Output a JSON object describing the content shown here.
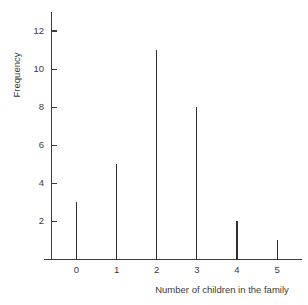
{
  "chart_data": {
    "type": "bar",
    "title": "",
    "subtitle": "",
    "xlabel": "Number of children in the family",
    "ylabel": "Frequency",
    "categories": [
      "0",
      "1",
      "2",
      "3",
      "4",
      "5"
    ],
    "values": [
      3,
      5,
      11,
      8,
      2,
      1
    ],
    "series": [
      {
        "name": "Frequency",
        "values": [
          3,
          5,
          11,
          8,
          2,
          1
        ]
      }
    ],
    "x": [
      0,
      1,
      2,
      3,
      4,
      5
    ],
    "xlim": [
      -0.62,
      5.62
    ],
    "ylim": [
      0,
      13
    ],
    "ytick_labels": [
      "2",
      "4",
      "6",
      "8",
      "10",
      "12"
    ],
    "ytick_values": [
      2,
      4,
      6,
      8,
      10,
      12
    ],
    "xtick_labels": [
      "0",
      "1",
      "2",
      "3",
      "4",
      "5"
    ],
    "xtick_values": [
      0,
      1,
      2,
      3,
      4,
      5
    ],
    "grid": false,
    "legend": false,
    "legend_position": "none",
    "annotations": [],
    "style": {
      "line_color": "#2f2f2f",
      "axis_color": "#3d3d3d",
      "text_color": "#3a3a3a",
      "background": "#ffffff"
    }
  }
}
